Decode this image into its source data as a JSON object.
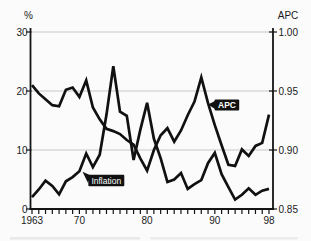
{
  "figure": {
    "left_axis_title": "%",
    "right_axis_title": "APC",
    "series_labels": {
      "inflation": "Inflation",
      "apc": "APC"
    }
  },
  "chart_data": {
    "type": "line",
    "title": "",
    "grid": true,
    "x_axis": {
      "range": [
        1963,
        1998
      ],
      "tick_every_year": true,
      "labels": [
        {
          "v": 1963,
          "label": "1963"
        },
        {
          "v": 1970,
          "label": "70"
        },
        {
          "v": 1980,
          "label": "80"
        },
        {
          "v": 1990,
          "label": "90"
        },
        {
          "v": 1998,
          "label": "98"
        }
      ]
    },
    "left_axis": {
      "title": "%",
      "range": [
        0,
        30
      ],
      "ticks": [
        {
          "v": 30,
          "label": "30"
        },
        {
          "v": 20,
          "label": "20"
        },
        {
          "v": 10,
          "label": "10"
        },
        {
          "v": 0,
          "label": "0"
        }
      ]
    },
    "right_axis": {
      "title": "APC",
      "range": [
        0.85,
        1.0
      ],
      "ticks": [
        {
          "v": 1.0,
          "label": "1.00"
        },
        {
          "v": 0.95,
          "label": "0.95"
        },
        {
          "v": 0.9,
          "label": "0.90"
        },
        {
          "v": 0.85,
          "label": "0.85"
        }
      ]
    },
    "series": [
      {
        "name": "Inflation",
        "axis": "left",
        "values": [
          2.0,
          3.3,
          4.8,
          3.9,
          2.5,
          4.7,
          5.4,
          6.4,
          9.4,
          7.1,
          9.2,
          16.0,
          24.2,
          16.5,
          15.8,
          8.3,
          13.4,
          18.0,
          11.9,
          8.6,
          4.6,
          5.0,
          6.1,
          3.4,
          4.2,
          4.9,
          7.8,
          9.5,
          5.9,
          3.7,
          1.6,
          2.4,
          3.5,
          2.4,
          3.1,
          3.4
        ]
      },
      {
        "name": "APC",
        "axis": "right",
        "values": [
          0.955,
          0.948,
          0.943,
          0.938,
          0.937,
          0.951,
          0.953,
          0.945,
          0.959,
          0.936,
          0.926,
          0.918,
          0.916,
          0.9135,
          0.9085,
          0.9045,
          0.893,
          0.8825,
          0.9,
          0.9125,
          0.9185,
          0.907,
          0.9165,
          0.9295,
          0.941,
          0.9615,
          0.9395,
          0.921,
          0.904,
          0.8875,
          0.8865,
          0.9005,
          0.895,
          0.9035,
          0.906,
          0.93
        ]
      }
    ]
  }
}
